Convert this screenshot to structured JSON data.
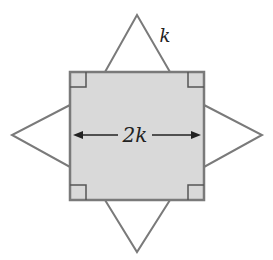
{
  "diagram": {
    "square_side_label": "2k",
    "triangle_side_label": "k",
    "colors": {
      "square_fill": "#d9d9d9",
      "stroke": "#7a7a7a",
      "text": "#222222"
    }
  }
}
